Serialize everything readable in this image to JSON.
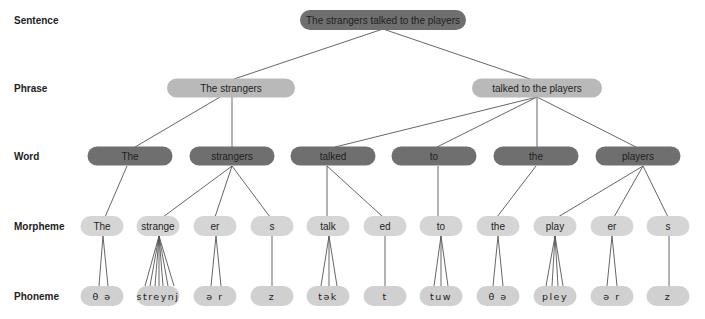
{
  "rows": {
    "sentence": "Sentence",
    "phrase": "Phrase",
    "word": "Word",
    "morpheme": "Morpheme",
    "phoneme": "Phoneme"
  },
  "sentence": {
    "text": "The strangers talked to the players"
  },
  "phrases": [
    {
      "text": "The strangers"
    },
    {
      "text": "talked to the players"
    }
  ],
  "words": [
    {
      "text": "The"
    },
    {
      "text": "strangers"
    },
    {
      "text": "talked"
    },
    {
      "text": "to"
    },
    {
      "text": "the"
    },
    {
      "text": "players"
    }
  ],
  "morphemes": [
    {
      "text": "The"
    },
    {
      "text": "strange"
    },
    {
      "text": "er"
    },
    {
      "text": "s"
    },
    {
      "text": "talk"
    },
    {
      "text": "ed"
    },
    {
      "text": "to"
    },
    {
      "text": "the"
    },
    {
      "text": "play"
    },
    {
      "text": "er"
    },
    {
      "text": "s"
    }
  ],
  "phonemes": [
    {
      "text": "θ ə",
      "count": 2
    },
    {
      "text": "streynj",
      "count": 7
    },
    {
      "text": "ə r",
      "count": 2
    },
    {
      "text": "z",
      "count": 1
    },
    {
      "text": "tək",
      "count": 3
    },
    {
      "text": "t",
      "count": 1
    },
    {
      "text": "tuw",
      "count": 3
    },
    {
      "text": "θ ə",
      "count": 2
    },
    {
      "text": "pley",
      "count": 4
    },
    {
      "text": "ə r",
      "count": 2
    },
    {
      "text": "z",
      "count": 1
    }
  ],
  "colors": {
    "sentence_fill": "#6f6f6f",
    "phrase_fill": "#b9b9b9",
    "word_fill": "#6f6f6f",
    "morpheme_fill": "#d5d5d5",
    "phoneme_fill": "#d0d0d0",
    "line": "#555555"
  }
}
